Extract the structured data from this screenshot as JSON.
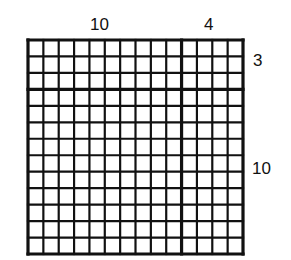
{
  "diagram": {
    "type": "area-model-grid",
    "top_labels": {
      "left": "10",
      "right": "4"
    },
    "side_labels": {
      "top": "3",
      "bottom": "10"
    },
    "grid": {
      "columns": 14,
      "rows": 13,
      "column_split_after": 10,
      "row_split_after": 3,
      "line_color": "#111111",
      "background": "#ffffff"
    }
  }
}
